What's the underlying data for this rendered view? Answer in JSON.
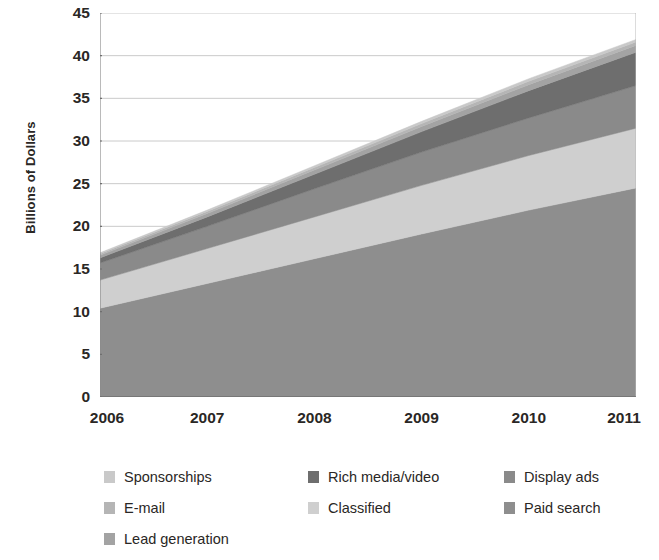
{
  "chart": {
    "type": "area",
    "ylabel": "Billions of Dollars",
    "xlabel": "",
    "title": "",
    "grid": true,
    "legend_position": "bottom"
  },
  "axis": {
    "y_ticks": [
      "45",
      "40",
      "35",
      "30",
      "25",
      "20",
      "15",
      "10",
      "5",
      "0"
    ],
    "x_ticks": [
      "2006",
      "2007",
      "2008",
      "2009",
      "2010",
      "2011"
    ]
  },
  "legend": {
    "items": [
      {
        "label": "Sponsorships",
        "color": "#c9c9c9",
        "col": 0,
        "row": 0
      },
      {
        "label": "Rich media/video",
        "color": "#6e6e6e",
        "col": 1,
        "row": 0
      },
      {
        "label": "Display ads",
        "color": "#8a8a8a",
        "col": 2,
        "row": 0
      },
      {
        "label": "E-mail",
        "color": "#b5b5b5",
        "col": 0,
        "row": 1
      },
      {
        "label": "Classified",
        "color": "#cfcfcf",
        "col": 1,
        "row": 1
      },
      {
        "label": "Paid search",
        "color": "#8e8e8e",
        "col": 2,
        "row": 1
      },
      {
        "label": "Lead generation",
        "color": "#a3a3a3",
        "col": 0,
        "row": 2
      }
    ]
  },
  "chart_data": {
    "type": "area",
    "stacked": true,
    "title": "",
    "xlabel": "",
    "ylabel": "Billions of Dollars",
    "x": [
      2006,
      2007,
      2008,
      2009,
      2010,
      2011
    ],
    "xlim": [
      2006,
      2011
    ],
    "ylim": [
      0,
      45
    ],
    "ytick_step": 5,
    "grid": true,
    "legend_position": "bottom",
    "stack_order_bottom_to_top": [
      "Paid search",
      "Classified",
      "Display ads",
      "Rich media/video",
      "Lead generation",
      "E-mail",
      "Sponsorships"
    ],
    "series": [
      {
        "name": "Paid search",
        "color": "#8e8e8e",
        "values": [
          10.4,
          13.3,
          16.2,
          19.1,
          21.9,
          24.5
        ]
      },
      {
        "name": "Classified",
        "color": "#cfcfcf",
        "values": [
          3.3,
          4.1,
          4.9,
          5.7,
          6.4,
          7.0
        ]
      },
      {
        "name": "Display ads",
        "color": "#8a8a8a",
        "values": [
          2.0,
          2.6,
          3.3,
          3.9,
          4.4,
          5.0
        ]
      },
      {
        "name": "Rich media/video",
        "color": "#6e6e6e",
        "values": [
          0.6,
          1.1,
          1.7,
          2.4,
          3.2,
          3.9
        ]
      },
      {
        "name": "Lead generation",
        "color": "#a3a3a3",
        "values": [
          0.3,
          0.4,
          0.5,
          0.6,
          0.7,
          0.8
        ]
      },
      {
        "name": "E-mail",
        "color": "#b5b5b5",
        "values": [
          0.2,
          0.25,
          0.3,
          0.35,
          0.4,
          0.4
        ]
      },
      {
        "name": "Sponsorships",
        "color": "#c9c9c9",
        "values": [
          0.1,
          0.15,
          0.2,
          0.25,
          0.3,
          0.3
        ]
      }
    ],
    "totals": [
      16.9,
      22.0,
      27.1,
      32.3,
      37.3,
      41.9
    ]
  }
}
